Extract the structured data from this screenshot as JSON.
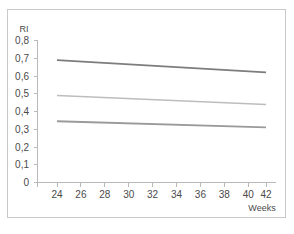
{
  "chart_data": {
    "type": "line",
    "title": "",
    "subtitle": "",
    "xlabel": "Weeks",
    "ylabel": "RI",
    "xlim": [
      23,
      43
    ],
    "ylim": [
      0,
      0.8
    ],
    "grid": false,
    "legend": "none",
    "x_ticks": [
      "24",
      "26",
      "28",
      "30",
      "32",
      "34",
      "36",
      "38",
      "40",
      "42"
    ],
    "x_tick_values": [
      24,
      26,
      28,
      30,
      32,
      34,
      36,
      38,
      40,
      42
    ],
    "y_ticks": [
      "0",
      "0,1",
      "0,2",
      "0,3",
      "0,4",
      "0,5",
      "0,6",
      "0,7",
      "0,8"
    ],
    "y_tick_values": [
      0,
      0.1,
      0.2,
      0.3,
      0.4,
      0.5,
      0.6,
      0.7,
      0.8
    ],
    "x": [
      24,
      42
    ],
    "series": [
      {
        "name": "upper-reference-line",
        "values": [
          0.69,
          0.62
        ],
        "color": "#7d7d7d",
        "width": 1.8
      },
      {
        "name": "median-reference-line",
        "values": [
          0.49,
          0.44
        ],
        "color": "#bdbdbd",
        "width": 1.5
      },
      {
        "name": "lower-reference-line",
        "values": [
          0.345,
          0.31
        ],
        "color": "#9a9a9a",
        "width": 1.8
      }
    ],
    "colors": {
      "axis": "#b9b9b9",
      "frame": "#c9c9c9",
      "text": "#4a4a4a",
      "background": "#ffffff"
    }
  }
}
